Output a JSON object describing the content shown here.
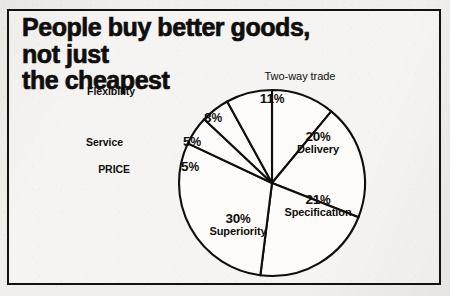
{
  "title": {
    "line1": "People buy better goods, not just",
    "line2": "the cheapest"
  },
  "colors": {
    "ink": "#100e0c",
    "paper": "#f1efec",
    "slice_fill": "#fdfcfa"
  },
  "chart_data": {
    "type": "pie",
    "title": "People buy better goods, not just the cheapest",
    "xlabel": "",
    "ylabel": "",
    "legend_position": "none",
    "grid": false,
    "units": "percent",
    "total": 100,
    "start_angle_deg": 0,
    "direction": "clockwise",
    "categories": [
      "Two-way trade",
      "Delivery",
      "Specification",
      "Superiority",
      "PRICE",
      "Service",
      "Flexibility"
    ],
    "values": [
      11,
      20,
      21,
      30,
      5,
      5,
      8
    ],
    "slices": [
      {
        "label": "Two-way trade",
        "value": 11,
        "value_text": "11",
        "percent_symbol": "%",
        "label_placement": "outside-top",
        "label_style": "regular",
        "label_x": 300,
        "label_y": 78,
        "value_x": 272,
        "value_y": 100
      },
      {
        "label": "Delivery",
        "value": 20,
        "value_text": "20",
        "percent_symbol": "%",
        "label_placement": "inside",
        "label_style": "bold",
        "value_x": 318,
        "value_y": 140
      },
      {
        "label": "Specification",
        "value": 21,
        "value_text": "21",
        "percent_symbol": "%",
        "label_placement": "inside",
        "label_style": "bold",
        "value_x": 318,
        "value_y": 203
      },
      {
        "label": "Superiority",
        "value": 30,
        "value_text": "30",
        "percent_symbol": "%",
        "label_placement": "inside",
        "label_style": "bold",
        "value_x": 238,
        "value_y": 222
      },
      {
        "label": "PRICE",
        "value": 5,
        "value_text": "5",
        "percent_symbol": "%",
        "label_placement": "outside-left",
        "label_style": "bold",
        "label_x": 130,
        "label_y": 171,
        "value_x": 190,
        "value_y": 168
      },
      {
        "label": "Service",
        "value": 5,
        "value_text": "5",
        "percent_symbol": "%",
        "label_placement": "outside-left",
        "label_style": "bold",
        "label_x": 123,
        "label_y": 144,
        "value_x": 192,
        "value_y": 143
      },
      {
        "label": "Flexibility",
        "value": 8,
        "value_text": "8",
        "percent_symbol": "%",
        "label_placement": "outside-left",
        "label_style": "bold",
        "label_x": 135,
        "label_y": 93,
        "value_x": 213,
        "value_y": 119
      }
    ],
    "geometry": {
      "center_x": 272,
      "center_y": 183,
      "radius": 93
    }
  }
}
